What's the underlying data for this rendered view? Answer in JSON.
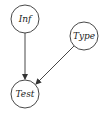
{
  "diagram": {
    "type": "directed-graph",
    "nodes": [
      {
        "id": "inf",
        "label": "Inf",
        "cx": 25,
        "cy": 19,
        "r": 14
      },
      {
        "id": "type",
        "label": "Type",
        "cx": 84,
        "cy": 36,
        "r": 14
      },
      {
        "id": "test",
        "label": "Test",
        "cx": 25,
        "cy": 94,
        "r": 14
      }
    ],
    "edges": [
      {
        "from": "Inf",
        "to": "Test"
      },
      {
        "from": "Type",
        "to": "Test"
      }
    ],
    "colors": {
      "stroke": "#333333",
      "background": "#ffffff"
    }
  }
}
